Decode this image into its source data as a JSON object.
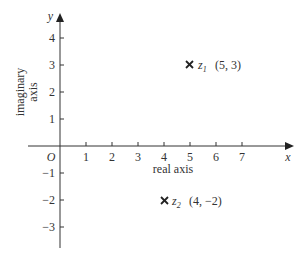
{
  "diagram": {
    "type": "argand-diagram",
    "x_axis": {
      "symbol": "x",
      "label": "real axis",
      "ticks": [
        "1",
        "2",
        "3",
        "4",
        "5",
        "6",
        "7"
      ]
    },
    "y_axis": {
      "symbol": "y",
      "label": "imaginary axis",
      "label_lines": [
        "imaginary",
        "axis"
      ],
      "ticks_positive": [
        "1",
        "2",
        "3",
        "4"
      ],
      "ticks_negative": [
        "−1",
        "−2",
        "−3"
      ]
    },
    "origin_label": "O",
    "points": [
      {
        "name": "z",
        "subscript": "1",
        "coords": "(5, 3)",
        "x": 5,
        "y": 3,
        "marker": "×"
      },
      {
        "name": "z",
        "subscript": "2",
        "coords": "(4, −2)",
        "x": 4,
        "y": -2,
        "marker": "×"
      }
    ],
    "colors": {
      "ink": "#333333",
      "background": "#ffffff"
    }
  }
}
